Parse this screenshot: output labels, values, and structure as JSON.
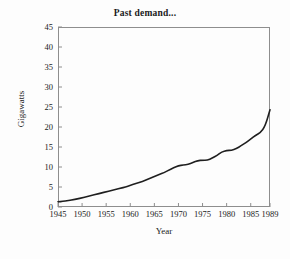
{
  "chart_data": {
    "type": "line",
    "title": "Past demand...",
    "xlabel": "Year",
    "ylabel": "Gigawatts",
    "xlim": [
      1945,
      1989
    ],
    "ylim": [
      0,
      45
    ],
    "xticks": [
      1945,
      1950,
      1955,
      1960,
      1965,
      1970,
      1975,
      1980,
      1985,
      1989
    ],
    "yticks": [
      0,
      5,
      10,
      15,
      20,
      25,
      30,
      35,
      40,
      45
    ],
    "grid": false,
    "legend": "none",
    "line_color": "#1f1f1f",
    "frame_color": "#8e8e8e",
    "background_color": "#fdfdfd",
    "series": [
      {
        "name": "Past demand",
        "x": [
          1945,
          1946,
          1947,
          1948,
          1949,
          1950,
          1951,
          1952,
          1953,
          1954,
          1955,
          1956,
          1957,
          1958,
          1959,
          1960,
          1961,
          1962,
          1963,
          1964,
          1965,
          1966,
          1967,
          1968,
          1969,
          1970,
          1971,
          1972,
          1973,
          1974,
          1975,
          1976,
          1977,
          1978,
          1979,
          1980,
          1981,
          1982,
          1983,
          1984,
          1985,
          1986,
          1987,
          1988,
          1989
        ],
        "values": [
          1.3,
          1.4,
          1.6,
          1.8,
          2.0,
          2.3,
          2.6,
          2.9,
          3.2,
          3.5,
          3.8,
          4.1,
          4.4,
          4.7,
          5.0,
          5.4,
          5.8,
          6.2,
          6.6,
          7.1,
          7.6,
          8.1,
          8.6,
          9.2,
          9.8,
          10.3,
          10.5,
          10.6,
          11.1,
          11.6,
          11.7,
          11.7,
          12.2,
          12.9,
          13.8,
          14.1,
          14.2,
          14.6,
          15.3,
          16.1,
          17.0,
          17.9,
          18.6,
          20.2,
          24.3
        ]
      }
    ]
  }
}
